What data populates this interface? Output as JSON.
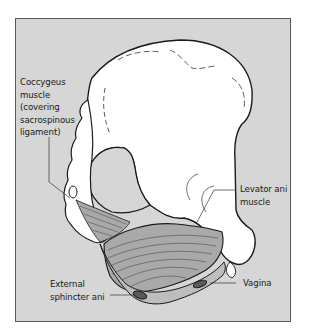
{
  "figure": {
    "background_color": "#d6d6d6",
    "bone_color": "#ffffff",
    "muscle_color": "#a9a9a9",
    "outline_color": "#1a1a1a"
  },
  "labels": {
    "coccygeus": {
      "lines": [
        "Coccygeus",
        "muscle",
        "(covering",
        "sacrospinous",
        "ligament)"
      ]
    },
    "levator_ani": {
      "lines": [
        "Levator ani",
        "muscle"
      ]
    },
    "external_sphincter": {
      "lines": [
        "External",
        "sphincter ani"
      ]
    },
    "vagina": {
      "lines": [
        "Vagina"
      ]
    }
  }
}
